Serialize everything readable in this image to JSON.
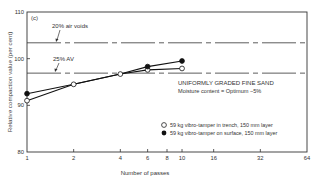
{
  "chart_data": {
    "type": "line",
    "panel_label": "(c)",
    "title": "",
    "xlabel": "Number of passes",
    "ylabel": "Relative compaction value (per cent)",
    "xscale": "log2",
    "xlim": [
      1,
      64
    ],
    "ylim": [
      80,
      110
    ],
    "x_ticks": [
      1,
      2,
      4,
      6,
      8,
      10,
      16,
      32,
      64
    ],
    "y_ticks": [
      80,
      90,
      100,
      110
    ],
    "grid": false,
    "reference_lines": [
      {
        "label": "20% air voids",
        "y": 103.4,
        "style": "dash-dot"
      },
      {
        "label": "25% AV",
        "y": 96.9,
        "style": "dash-dot"
      }
    ],
    "annotations": [
      "UNIFORMLY GRADED FINE SAND",
      "Moisture content = Optimum −5%"
    ],
    "series": [
      {
        "name": "59 kg vibro-tamper in trench, 150 mm layer",
        "marker": "open-circle",
        "x": [
          1,
          2,
          4,
          6,
          10
        ],
        "y": [
          91.0,
          94.5,
          96.7,
          97.6,
          97.9
        ]
      },
      {
        "name": "59 kg vibro-tamper on surface, 150 mm layer",
        "marker": "filled-circle",
        "x": [
          1,
          2,
          4,
          6,
          10
        ],
        "y": [
          92.5,
          94.5,
          96.7,
          98.3,
          99.5
        ]
      }
    ],
    "legend_position": "lower right"
  },
  "labels": {
    "panel": "(c)",
    "ref_20": "20% air voids",
    "ref_25": "25% AV",
    "note_1": "UNIFORMLY GRADED FINE SAND",
    "note_2": "Moisture content = Optimum −5%",
    "legend_open": "59 kg vibro-tamper in trench, 150 mm layer",
    "legend_filled": "59 kg vibro-tamper on surface, 150 mm layer",
    "xlabel": "Number of passes",
    "ylabel": "Relative compaction value (per cent)"
  }
}
